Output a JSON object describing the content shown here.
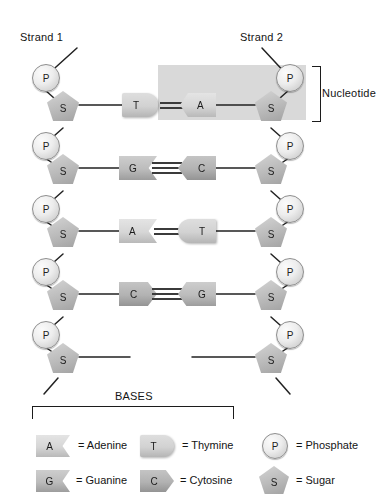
{
  "diagram": {
    "strand_labels": {
      "left": "Strand 1",
      "right": "Strand 2"
    },
    "nucleotide_label": "Nucleotide",
    "backbone_symbols": {
      "phosphate": "P",
      "sugar": "S"
    },
    "rows": [
      {
        "left_base": "T",
        "right_base": "A",
        "bonds": 2,
        "left_shape": "round-right",
        "right_shape": "notch-left"
      },
      {
        "left_base": "G",
        "right_base": "C",
        "bonds": 3,
        "left_shape": "notch-right",
        "right_shape": "point-left"
      },
      {
        "left_base": "A",
        "right_base": "T",
        "bonds": 2,
        "left_shape": "notch-right",
        "right_shape": "round-left"
      },
      {
        "left_base": "C",
        "right_base": "G",
        "bonds": 3,
        "left_shape": "point-right",
        "right_shape": "notch-left"
      }
    ]
  },
  "legend": {
    "title": "BASES",
    "bases": [
      {
        "symbol": "A",
        "text": "= Adenine",
        "shape": "notch-right",
        "tone": "light"
      },
      {
        "symbol": "T",
        "text": "= Thymine",
        "shape": "round-right",
        "tone": "light"
      },
      {
        "symbol": "G",
        "text": "= Guanine",
        "shape": "notch-right",
        "tone": "dark"
      },
      {
        "symbol": "C",
        "text": "= Cytosine",
        "shape": "point-right",
        "tone": "dark"
      }
    ],
    "backbone": [
      {
        "symbol": "P",
        "text": "= Phosphate"
      },
      {
        "symbol": "S",
        "text": "= Sugar"
      }
    ]
  },
  "colors": {
    "highlight": "#d9d9d9",
    "base_light": "#d8d8d8",
    "base_dark": "#b4b4b4",
    "ink": "#1a1a1a"
  }
}
